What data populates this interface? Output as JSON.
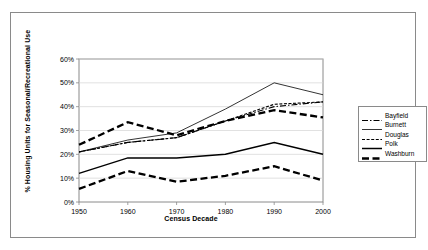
{
  "chart_data": {
    "type": "line",
    "title": "",
    "xlabel": "Census Decade",
    "ylabel": "% Housing Units for Seasonal/Recreational Use",
    "categories": [
      "1950",
      "1960",
      "1970",
      "1980",
      "1990",
      "2000"
    ],
    "x": [
      1950,
      1960,
      1970,
      1980,
      1990,
      2000
    ],
    "xlim": [
      1950,
      2000
    ],
    "ylim": [
      0,
      60
    ],
    "yticks": [
      "0%",
      "10%",
      "20%",
      "30%",
      "40%",
      "50%",
      "60%"
    ],
    "ytick_values": [
      0,
      10,
      20,
      30,
      40,
      50,
      60
    ],
    "grid": "horizontal",
    "legend_position": "right",
    "series": [
      {
        "name": "Bayfield",
        "style": "dash-dot",
        "color": "#000000",
        "values": [
          21,
          25,
          27,
          34,
          40,
          42
        ]
      },
      {
        "name": "Burnett",
        "style": "thin-solid",
        "color": "#000000",
        "values": [
          21,
          26,
          29,
          39,
          50,
          45
        ]
      },
      {
        "name": "Douglas",
        "style": "fine-dash",
        "color": "#000000",
        "values": [
          21,
          25,
          27,
          34,
          41,
          42
        ]
      },
      {
        "name": "Polk",
        "style": "solid",
        "color": "#000000",
        "values": [
          12,
          18.5,
          18.5,
          20,
          25,
          20
        ]
      },
      {
        "name": "Washburn",
        "style": "bold-dash",
        "color": "#000000",
        "values": [
          24,
          33.5,
          28,
          34,
          38.5,
          35.5
        ]
      }
    ],
    "secondary_series": [
      {
        "name": "Polk-lower",
        "style": "bold-dash",
        "values": [
          5.5,
          13,
          8.5,
          11,
          15,
          9
        ]
      }
    ]
  },
  "legend": {
    "entries": [
      {
        "label": "Bayfield"
      },
      {
        "label": "Burnett"
      },
      {
        "label": "Douglas"
      },
      {
        "label": "Polk"
      },
      {
        "label": "Washburn"
      }
    ]
  }
}
